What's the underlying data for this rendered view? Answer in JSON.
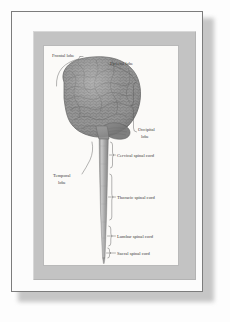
{
  "artwork": {
    "kind": "framed-anatomical-illustration",
    "subject": "Human brain and spinal cord, lateral view",
    "labels": [
      {
        "id": "frontal-lobe",
        "text": "Frontal lobe",
        "lines": [
          "Frontal lobe"
        ],
        "x": 8,
        "y": 11,
        "anchor": "start"
      },
      {
        "id": "parietal-lobe",
        "text": "Parietal lobe",
        "lines": [
          "Parietal lobe"
        ],
        "x": 66,
        "y": 19,
        "anchor": "start"
      },
      {
        "id": "occipital-lobe",
        "text": "Occipital lobe",
        "lines": [
          "Occipital",
          "lobe"
        ],
        "x": 94,
        "y": 85,
        "anchor": "start"
      },
      {
        "id": "temporal-lobe",
        "text": "Temporal lobe",
        "lines": [
          "Temporal",
          "lobe"
        ],
        "x": 9,
        "y": 131,
        "anchor": "start"
      },
      {
        "id": "cervical-spinal-cord",
        "text": "Cervical spinal cord",
        "lines": [
          "Cervical spinal cord"
        ],
        "x": 73,
        "y": 110,
        "anchor": "start"
      },
      {
        "id": "thoracic-spinal-cord",
        "text": "Thoracic spinal cord",
        "lines": [
          "Thoracic spinal cord"
        ],
        "x": 73,
        "y": 152,
        "anchor": "start"
      },
      {
        "id": "lumbar-spinal-cord",
        "text": "Lumbar spinal cord",
        "lines": [
          "Lumbar spinal cord"
        ],
        "x": 73,
        "y": 191,
        "anchor": "start"
      },
      {
        "id": "sacral-spinal-cord",
        "text": "Sacral spinal cord",
        "lines": [
          "Sacral spinal cord"
        ],
        "x": 73,
        "y": 208,
        "anchor": "start"
      }
    ],
    "label_text": {
      "frontal": "Frontal lobe",
      "parietal": "Parietal lobe",
      "occipital_1": "Occipital",
      "occipital_2": "lobe",
      "temporal_1": "Temporal",
      "temporal_2": "lobe",
      "cervical": "Cervical spinal cord",
      "thoracic": "Thoracic spinal cord",
      "lumbar": "Lumbar spinal cord",
      "sacral": "Sacral spinal cord"
    },
    "colors": {
      "page_background": "#ffffff",
      "frame_border": "#7c7c7c",
      "frame_paper": "#fcfcfc",
      "mat_board": "#c3c3c3",
      "image_plate": "#fbfaf8",
      "brain_fill": "#8d8d8d",
      "brain_outline": "#5d5d5d",
      "cord_fill": "#a9a9a9",
      "label_text": "#3b3b3b",
      "leader_line": "#5a5a5a",
      "shadow": "#9a9a9a"
    }
  }
}
